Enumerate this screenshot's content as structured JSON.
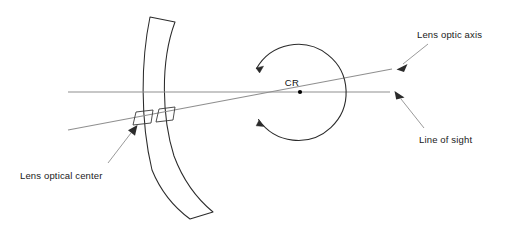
{
  "figure": {
    "type": "optical-diagram",
    "title": "",
    "background_color": "#ffffff",
    "line_color": "#8a8a8a",
    "outline_color": "#2b2b2b",
    "text_color": "#1a1a1a"
  },
  "labels": {
    "lens_optic_axis": "Lens optic axis",
    "line_of_sight": "Line of sight",
    "lens_optical_center": "Lens optical center",
    "center_of_rotation": "CR"
  },
  "elements": {
    "lens": {
      "name": "meniscus-lens",
      "description": "curved crescent spectacle lens",
      "outline_color": "#2b2b2b"
    },
    "eye": {
      "name": "eyeball-circle",
      "description": "circle representing the eye with rotation arrows",
      "center_x": 300,
      "center_y": 92,
      "radius": 48,
      "outline_color": "#2b2b2b"
    },
    "cr_point": {
      "name": "center-of-rotation-point",
      "x": 300,
      "y": 92,
      "color": "#000000"
    },
    "line_of_sight_axis": {
      "name": "line-of-sight",
      "x1": 68,
      "y1": 92,
      "x2": 390,
      "y2": 92,
      "color": "#8a8a8a"
    },
    "lens_optic_axis_line": {
      "name": "lens-optic-axis",
      "x1": 68,
      "y1": 130,
      "x2": 392,
      "y2": 69,
      "color": "#8a8a8a"
    },
    "right_angle_marker": {
      "name": "perpendicular-marker",
      "x": 137,
      "y": 118
    }
  }
}
